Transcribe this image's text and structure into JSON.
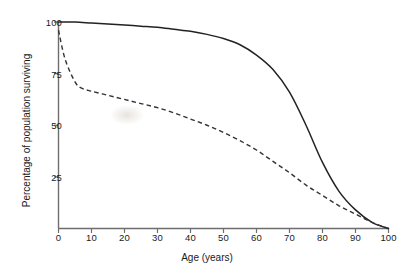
{
  "chart_data": {
    "type": "line",
    "title": "",
    "xlabel": "Age (years)",
    "ylabel": "Percentage of population surviving",
    "xlim": [
      0,
      100
    ],
    "ylim": [
      0,
      100
    ],
    "grid": false,
    "legend_position": "none",
    "xticks": [
      0,
      10,
      20,
      30,
      40,
      50,
      60,
      70,
      80,
      90,
      100
    ],
    "xtick_labels": [
      "0",
      "10",
      "20",
      "30",
      "40",
      "50",
      "60",
      "70",
      "80",
      "90",
      "100"
    ],
    "yticks": [
      25,
      50,
      75,
      100
    ],
    "ytick_labels": [
      "25",
      "50",
      "75",
      "100"
    ],
    "series": [
      {
        "name": "solid-survivorship-curve",
        "style": "solid",
        "color": "#222222",
        "x": [
          0,
          5,
          10,
          15,
          20,
          25,
          30,
          35,
          40,
          45,
          50,
          55,
          60,
          65,
          70,
          75,
          80,
          85,
          90,
          95,
          100
        ],
        "values": [
          100,
          100,
          99.5,
          99,
          98.5,
          98,
          97.5,
          96.5,
          95.5,
          94,
          92,
          89,
          84,
          77,
          66,
          50,
          32,
          18,
          9,
          3,
          0
        ]
      },
      {
        "name": "dashed-survivorship-curve",
        "style": "dashed",
        "color": "#333333",
        "x": [
          0,
          2,
          5,
          7,
          10,
          15,
          20,
          25,
          30,
          35,
          40,
          45,
          50,
          55,
          60,
          65,
          70,
          75,
          80,
          85,
          90,
          95,
          100
        ],
        "values": [
          96,
          82,
          71,
          68,
          66.5,
          64.5,
          62.5,
          60.5,
          58.5,
          56,
          53,
          50,
          46.5,
          42.5,
          38,
          32.5,
          27,
          21,
          16,
          11,
          7,
          3,
          0
        ]
      }
    ],
    "annotations": []
  },
  "axis": {
    "x_title": "Age (years)",
    "y_title": "Percentage of population surviving"
  }
}
